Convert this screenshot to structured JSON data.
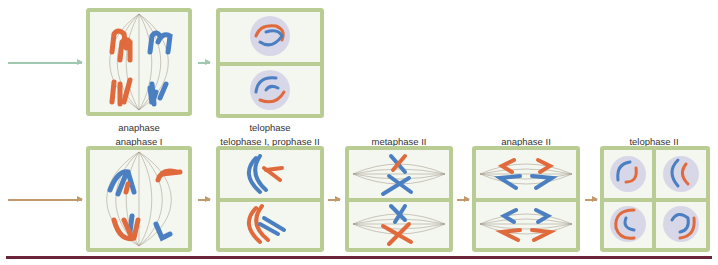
{
  "figure": {
    "colors": {
      "maternal": "#e06a3c",
      "paternal": "#4a7fc1",
      "cell_wall": "#b9cc94",
      "cell_fill": "#f4f6f0",
      "mitosis_arrow": "#9fc8b0",
      "meiosis_arrow": "#c09a6a",
      "rule": "#6b2438"
    },
    "mitosis_row": {
      "stages": [
        {
          "label": "anaphase"
        },
        {
          "label": "telophase"
        }
      ]
    },
    "meiosis_row": {
      "stages": [
        {
          "label": "anaphase I"
        },
        {
          "label": "telophase I, prophase II"
        },
        {
          "label": "metaphase II"
        },
        {
          "label": "anaphase II"
        },
        {
          "label": "telophase II"
        }
      ]
    }
  }
}
